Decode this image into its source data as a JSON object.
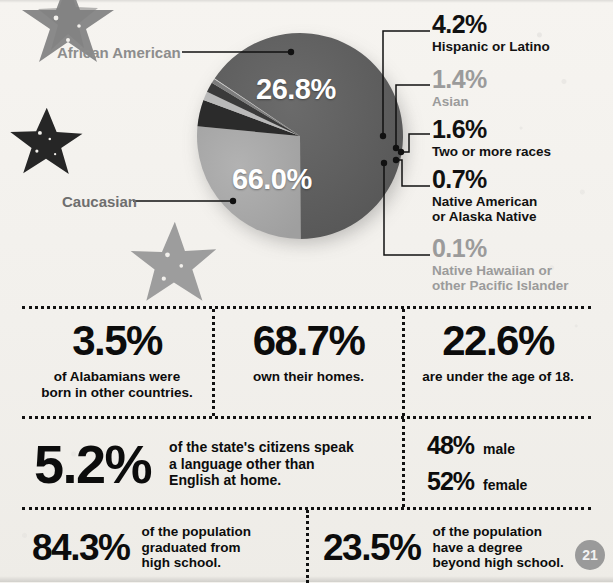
{
  "page": {
    "number": "21",
    "background_color": "#f4f2ee"
  },
  "chart_data": {
    "type": "pie",
    "title": "",
    "categories": [
      "Caucasian",
      "African American",
      "Hispanic or Latino",
      "Asian",
      "Two or more races",
      "Native American or Alaska Native",
      "Native Hawaiian or other Pacific Islander"
    ],
    "values": [
      66.0,
      26.8,
      4.2,
      1.4,
      1.6,
      0.7,
      0.1
    ],
    "value_labels": [
      "66.0%",
      "26.8%",
      "4.2%",
      "1.4%",
      "1.6%",
      "0.7%",
      "0.1%"
    ],
    "colors": [
      "#5e5e5e",
      "#a8a8a8",
      "#2b2b2b",
      "#b9b9b9",
      "#3a3a3a",
      "#7d7d7d",
      "#cfcfcf"
    ],
    "legend_position": "right",
    "grid": false,
    "labels_inside": [
      "66.0%",
      "26.8%"
    ],
    "start_angle_deg": -56
  },
  "pie": {
    "inside_labels": [
      {
        "name": "african-american",
        "value": "26.8%"
      },
      {
        "name": "caucasian",
        "value": "66.0%"
      }
    ],
    "side_labels": [
      {
        "name": "african-american",
        "text": "African American",
        "color": "#8d8d8d"
      },
      {
        "name": "caucasian",
        "text": "Caucasian",
        "color": "#6e6e6e"
      }
    ],
    "legend": [
      {
        "name": "hispanic",
        "pct": "4.2%",
        "label": "Hispanic or Latino",
        "tone": "dark"
      },
      {
        "name": "asian",
        "pct": "1.4%",
        "label": "Asian",
        "tone": "grey"
      },
      {
        "name": "two-or-more",
        "pct": "1.6%",
        "label": "Two or more races",
        "tone": "dark"
      },
      {
        "name": "native-american",
        "pct": "0.7%",
        "label_line1": "Native American",
        "label_line2": "or Alaska Native",
        "tone": "dark"
      },
      {
        "name": "native-hawaiian",
        "pct": "0.1%",
        "label_line1": "Native Hawaiian or",
        "label_line2": "other Pacific Islander",
        "tone": "grey"
      }
    ]
  },
  "stats": {
    "foreign_born": {
      "value": "3.5%",
      "line1": "of Alabamians were",
      "line2": "born in other countries."
    },
    "home_owners": {
      "value": "68.7%",
      "line1": "own their homes."
    },
    "under_18": {
      "value": "22.6%",
      "line1": "are under the age of 18."
    },
    "language": {
      "value": "5.2%",
      "line1": "of the state's citizens speak",
      "line2": "a language other than",
      "line3": "English at home."
    },
    "gender": {
      "male_value": "48%",
      "male_label": "male",
      "female_value": "52%",
      "female_label": "female"
    },
    "hs_graduate": {
      "value": "84.3%",
      "line1": "of the population",
      "line2": "graduated from",
      "line3": "high school."
    },
    "degree": {
      "value": "23.5%",
      "line1": "of the population",
      "line2": "have a degree",
      "line3": "beyond high school."
    }
  }
}
